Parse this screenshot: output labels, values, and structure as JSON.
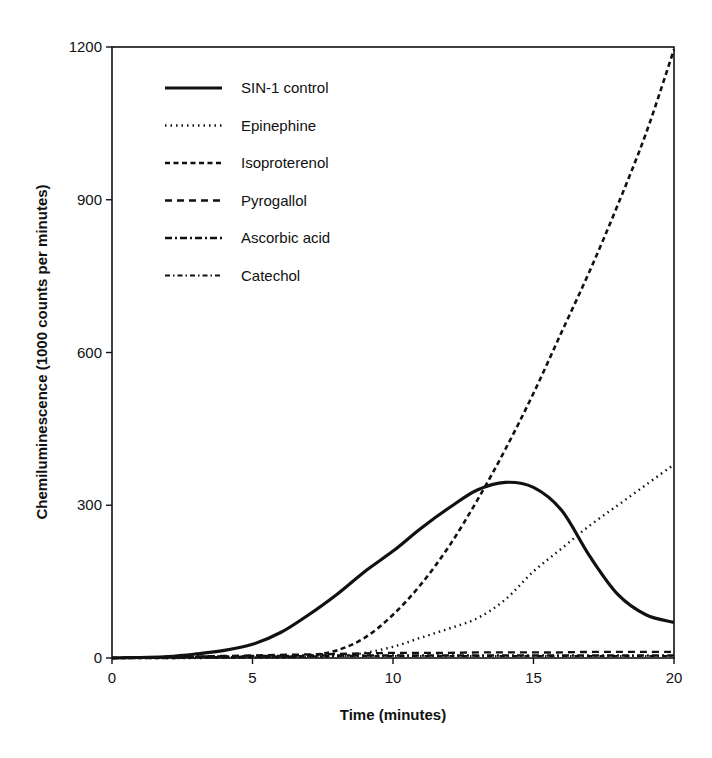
{
  "chart_data": {
    "type": "line",
    "title": "",
    "xlabel": "Time  (minutes)",
    "ylabel": "Chemiluminescence (1000 counts per minutes)",
    "xlim": [
      0,
      20
    ],
    "ylim": [
      0,
      1200
    ],
    "xticks": [
      0,
      5,
      10,
      15,
      20
    ],
    "yticks": [
      0,
      300,
      600,
      900,
      1200
    ],
    "grid": false,
    "legend_position": "upper-left inside",
    "x": [
      0,
      1,
      2,
      3,
      4,
      5,
      6,
      7,
      8,
      9,
      10,
      11,
      12,
      13,
      14,
      15,
      16,
      17,
      18,
      19,
      20
    ],
    "series": [
      {
        "name": "SIN-1 control",
        "style": "solid",
        "values": [
          0,
          1,
          3,
          8,
          15,
          27,
          50,
          85,
          125,
          170,
          210,
          255,
          295,
          330,
          345,
          335,
          290,
          200,
          125,
          85,
          70
        ]
      },
      {
        "name": "Epinephine",
        "style": "dotted",
        "values": [
          0,
          0,
          0,
          0,
          1,
          1,
          1,
          2,
          3,
          10,
          22,
          40,
          58,
          78,
          115,
          170,
          215,
          260,
          300,
          340,
          380
        ]
      },
      {
        "name": "Isoproterenol",
        "style": "dashed-short",
        "values": [
          0,
          0,
          0,
          1,
          1,
          2,
          2,
          5,
          15,
          40,
          85,
          145,
          220,
          310,
          410,
          520,
          640,
          760,
          890,
          1030,
          1195
        ]
      },
      {
        "name": "Pyrogallol",
        "style": "dashed-long",
        "values": [
          0,
          1,
          2,
          3,
          4,
          5,
          6,
          7,
          8,
          9,
          10,
          10,
          10,
          11,
          11,
          11,
          11,
          12,
          12,
          12,
          12
        ]
      },
      {
        "name": "Ascorbic acid",
        "style": "dash-dot",
        "values": [
          0,
          1,
          2,
          3,
          3,
          4,
          4,
          5,
          5,
          5,
          5,
          5,
          5,
          5,
          5,
          5,
          5,
          5,
          5,
          5,
          5
        ]
      },
      {
        "name": "Catechol",
        "style": "dash-dot-fine",
        "values": [
          0,
          1,
          1,
          2,
          2,
          3,
          3,
          3,
          4,
          4,
          4,
          4,
          4,
          4,
          4,
          4,
          4,
          4,
          4,
          4,
          4
        ]
      }
    ]
  },
  "legend": {
    "items": [
      {
        "label": "SIN-1 control"
      },
      {
        "label": "Epinephine"
      },
      {
        "label": "Isoproterenol"
      },
      {
        "label": "Pyrogallol"
      },
      {
        "label": "Ascorbic acid"
      },
      {
        "label": "Catechol"
      }
    ]
  },
  "axes": {
    "x_title": "Time  (minutes)",
    "y_title": "Chemiluminescence (1000 counts per minutes)",
    "x_tick_labels": [
      "0",
      "5",
      "10",
      "15",
      "20"
    ],
    "y_tick_labels": [
      "0",
      "300",
      "600",
      "900",
      "1200"
    ]
  }
}
